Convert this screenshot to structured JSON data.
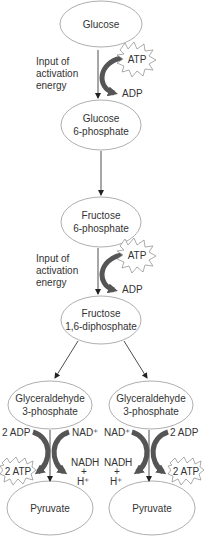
{
  "diagram": {
    "nodes": [
      {
        "id": "glucose",
        "lines": [
          "Glucose"
        ]
      },
      {
        "id": "glucose-6-phosphate",
        "lines": [
          "Glucose",
          "6-phosphate"
        ]
      },
      {
        "id": "fructose-6-phosphate",
        "lines": [
          "Fructose",
          "6-phosphate"
        ]
      },
      {
        "id": "fructose-1-6-diphosphate",
        "lines": [
          "Fructose",
          "1,6-diphosphate"
        ]
      },
      {
        "id": "glyceraldehyde-3-phosphate-left",
        "lines": [
          "Glyceraldehyde",
          "3-phosphate"
        ]
      },
      {
        "id": "glyceraldehyde-3-phosphate-right",
        "lines": [
          "Glyceraldehyde",
          "3-phosphate"
        ]
      },
      {
        "id": "pyruvate-left",
        "lines": [
          "Pyruvate"
        ]
      },
      {
        "id": "pyruvate-right",
        "lines": [
          "Pyruvate"
        ]
      }
    ],
    "activation_label_1": [
      "Input of",
      "activation",
      "energy"
    ],
    "activation_label_2": [
      "Input of",
      "activation",
      "energy"
    ],
    "atp_in": "ATP",
    "adp_out": "ADP",
    "left_step": {
      "adp_in": "2 ADP",
      "atp_out": "2 ATP",
      "nad_in": "NAD⁺",
      "nadh_out": [
        "NADH",
        "+",
        "H⁺"
      ]
    },
    "right_step": {
      "adp_in": "2 ADP",
      "atp_out": "2 ATP",
      "nad_in": "NAD⁺",
      "nadh_out": [
        "NADH",
        "+",
        "H⁺"
      ]
    },
    "colors": {
      "ellipse_stroke": "#999999",
      "curved_arrow": "#555555",
      "line": "#222222",
      "text": "#333333"
    }
  }
}
